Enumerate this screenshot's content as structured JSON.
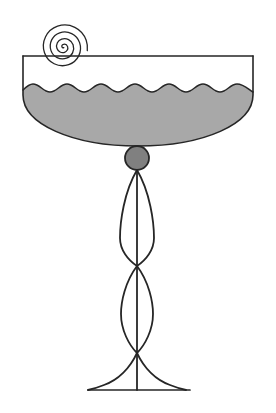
{
  "figure": {
    "caption": "",
    "background_color": "#ffffff",
    "canvas": {
      "width": 276,
      "height": 413
    }
  },
  "style": {
    "outline_color": "#262626",
    "liquid_fill_color": "#a8a8a8",
    "knop_fill_color": "#808080",
    "bowl_empty_fill_color": "#ffffff",
    "stroke_width_bowl": 1.6,
    "stroke_width_stem": 1.8,
    "stroke_width_spiral": 1.3
  },
  "parts": [
    {
      "id": "bowl",
      "label": "Bowl",
      "rim_y": 56,
      "left_x": 23,
      "right_x": 253,
      "bottom_y": 146,
      "rim_width": 230,
      "depth": 90
    },
    {
      "id": "rim-line",
      "label": "Rim line",
      "x1": 23,
      "y1": 56,
      "x2": 253,
      "y2": 56
    },
    {
      "id": "liquid",
      "label": "Liquid with wavy surface",
      "surface_mid_y": 88,
      "wave_count": 9,
      "wave_amplitude": 4.5,
      "wave_period": 25.6,
      "fill": "#a8a8a8"
    },
    {
      "id": "spiral",
      "label": "Spiral ornament",
      "center_x": 62,
      "center_y": 47,
      "outer_radius": 26,
      "turns": 2.6,
      "end_angle_deg": -40
    },
    {
      "id": "knop",
      "label": "Spherical knop",
      "center_x": 137,
      "center_y": 158,
      "radius": 12,
      "fill": "#808080"
    },
    {
      "id": "stem-lens-upper",
      "label": "Upper lens stem segment",
      "top_y": 170,
      "bottom_y": 266,
      "center_x": 137,
      "half_width": 17
    },
    {
      "id": "stem-lens-lower",
      "label": "Lower lens stem segment",
      "top_y": 266,
      "bottom_y": 353,
      "center_x": 137,
      "half_width": 16
    },
    {
      "id": "stem-center-line",
      "label": "Stem centre line",
      "x": 137,
      "top_y": 170,
      "bottom_y": 390
    },
    {
      "id": "foot",
      "label": "Flared foot",
      "apex_x": 137,
      "apex_y": 353,
      "base_y": 390,
      "base_left_x": 88,
      "base_right_x": 190,
      "base_width": 102
    }
  ],
  "annotations": {
    "visible_text": []
  }
}
